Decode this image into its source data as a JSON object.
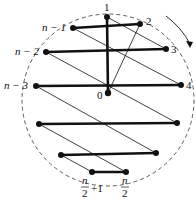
{
  "diagram": {
    "circle": {
      "cx": 108,
      "cy": 100,
      "r": 86,
      "style": "dashed"
    },
    "center": {
      "id": "0",
      "label": "0",
      "x": 108,
      "y": 93
    },
    "vertices": [
      {
        "id": "1",
        "label": "1",
        "x": 107,
        "y": 17
      },
      {
        "id": "2",
        "label": "2",
        "x": 140,
        "y": 24
      },
      {
        "id": "3",
        "label": "3",
        "x": 166,
        "y": 49
      },
      {
        "id": "4",
        "label": "4",
        "x": 181,
        "y": 85
      },
      {
        "id": "r5",
        "label": "",
        "x": 177,
        "y": 123
      },
      {
        "id": "r6",
        "label": "",
        "x": 156,
        "y": 153
      },
      {
        "id": "n/2",
        "label": "n/2",
        "x": 126,
        "y": 172
      },
      {
        "id": "n/2+1",
        "label": "n/2 + 1",
        "x": 92,
        "y": 172
      },
      {
        "id": "l6",
        "label": "",
        "x": 61,
        "y": 155
      },
      {
        "id": "l5",
        "label": "",
        "x": 39,
        "y": 124
      },
      {
        "id": "n-3",
        "label": "n − 3",
        "x": 36,
        "y": 86
      },
      {
        "id": "n-2",
        "label": "n − 2",
        "x": 46,
        "y": 52
      },
      {
        "id": "n-1",
        "label": "n − 1",
        "x": 73,
        "y": 28
      }
    ],
    "thick_edges": [
      [
        "1",
        "0"
      ],
      [
        "n-1",
        "2"
      ],
      [
        "n-2",
        "3"
      ],
      [
        "n-3",
        "4"
      ],
      [
        "l5",
        "r5"
      ],
      [
        "l6",
        "r6"
      ],
      [
        "n/2+1",
        "n/2"
      ]
    ],
    "thin_edges": [
      [
        "0",
        "2"
      ],
      [
        "1",
        "3"
      ],
      [
        "n-1",
        "4"
      ],
      [
        "n-2",
        "r5"
      ],
      [
        "n-3",
        "r6"
      ],
      [
        "l5",
        "n/2"
      ],
      [
        "l6",
        "n/2+1"
      ]
    ],
    "arrow": {
      "direction": "clockwise",
      "label": ""
    },
    "colors": {
      "stroke": "#111111",
      "background": "#ffffff"
    }
  }
}
